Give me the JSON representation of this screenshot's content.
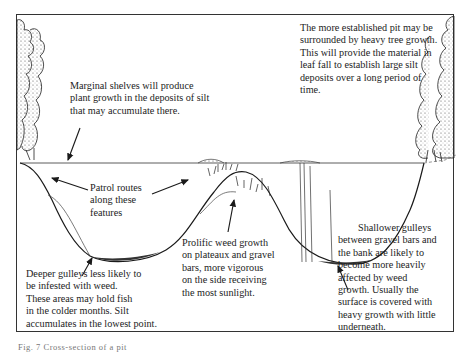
{
  "figure": {
    "caption": "Fig. 7 Cross-section of a pit",
    "colors": {
      "ink": "#1a1a1a",
      "background": "#ffffff",
      "border": "#333333"
    }
  },
  "annotations": {
    "established_pit": {
      "lines": [
        "The more established pit may be",
        "surrounded by heavy tree growth.",
        "This will provide the material in",
        "leaf fall to establish large silt",
        "deposits over a long period of",
        "time."
      ]
    },
    "marginal_shelves": {
      "lines": [
        "Marginal shelves will produce",
        "plant growth in the deposits of silt",
        "that may accumulate there."
      ]
    },
    "patrol_routes": {
      "lines": [
        "Patrol routes",
        "along these",
        "features"
      ]
    },
    "deeper_gulleys": {
      "lines": [
        "Deeper gulleys less likely to",
        "be infested with weed.",
        "These areas may hold fish",
        "in the colder months. Silt",
        "accumulates in the lowest point."
      ]
    },
    "prolific_weed": {
      "lines": [
        "Prolific weed growth",
        "on plateaux and gravel",
        "bars, more vigorous",
        "on the side receiving",
        "the most sunlight."
      ]
    },
    "shallower_gulleys": {
      "lines": [
        "Shallower gulleys",
        "between gravel bars and",
        "the bank are likely to",
        "become more heavily",
        "affected by weed",
        "growth. Usually the",
        "surface is covered with",
        "heavy growth with little",
        "underneath."
      ]
    }
  }
}
